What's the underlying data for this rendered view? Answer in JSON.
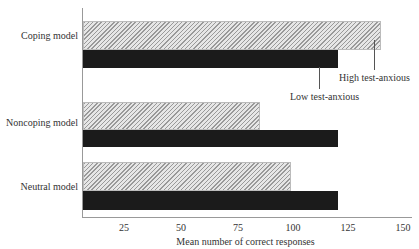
{
  "chart_data": {
    "type": "bar",
    "orientation": "horizontal",
    "title": "",
    "xlabel": "Mean number of correct responses",
    "ylabel": "",
    "categories": [
      "Coping model",
      "Noncoping model",
      "Neutral model"
    ],
    "series": [
      {
        "name": "High test-anxious",
        "pattern": "hatched",
        "values": [
          140,
          86,
          100
        ]
      },
      {
        "name": "Low test-anxious",
        "pattern": "solid-black",
        "values": [
          121,
          121,
          121
        ]
      }
    ],
    "xticks": [
      25,
      50,
      75,
      100,
      125,
      150
    ],
    "xlim": [
      7,
      155
    ],
    "grid": false,
    "legend_position": "annotation-leader-lines-on-top-bars"
  },
  "labels": {
    "cat0": "Coping model",
    "cat1": "Noncoping model",
    "cat2": "Neutral model",
    "legend_high": "High test-anxious",
    "legend_low": "Low test-anxious",
    "xlabel": "Mean number of correct responses",
    "ticks": [
      "25",
      "50",
      "75",
      "100",
      "125",
      "150"
    ]
  }
}
